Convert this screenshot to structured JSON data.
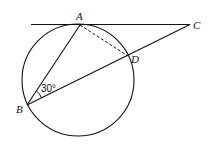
{
  "figure": {
    "type": "geometry",
    "points": {
      "A": "A",
      "B": "B",
      "C": "C",
      "D": "D"
    },
    "angle_label": "30°",
    "segments": [
      {
        "name": "tangent-AC",
        "from": "A",
        "to": "C",
        "style": "solid",
        "note": "tangent to circle at A, extends left past A"
      },
      {
        "name": "chord-AB",
        "from": "A",
        "to": "B",
        "style": "solid"
      },
      {
        "name": "secant-BC",
        "from": "B",
        "to": "C",
        "style": "solid",
        "passes_through": "D"
      },
      {
        "name": "chord-AD",
        "from": "A",
        "to": "D",
        "style": "dashed"
      }
    ],
    "given": {
      "angle_ABD_degrees": 30
    }
  }
}
